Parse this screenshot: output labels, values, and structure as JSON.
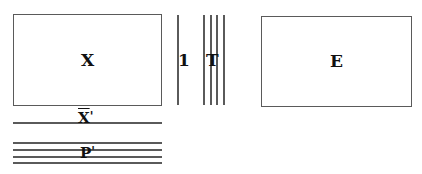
{
  "diagram": {
    "matrix_x": {
      "label": "X"
    },
    "vector_one": {
      "label": "1"
    },
    "matrix_t": {
      "label": "T"
    },
    "matrix_e": {
      "label": "E"
    },
    "row_xbar": {
      "label": "X",
      "prime": "'"
    },
    "rows_p": {
      "label": "P",
      "prime": "'"
    }
  },
  "colors": {
    "stroke": "#5a5a5a",
    "text": "#111111",
    "background": "#ffffff"
  }
}
